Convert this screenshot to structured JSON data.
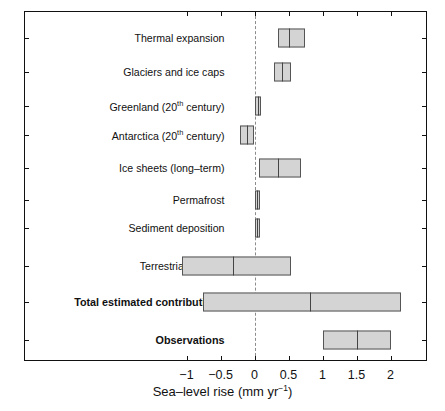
{
  "chart_data": {
    "type": "bar",
    "orientation": "horizontal",
    "title": "",
    "xlabel": "Sea-level rise (mm yr<sup>-1</sup>)",
    "xlabel_text": "Sea–level rise (mm yr",
    "xlabel_sup": "−1",
    "xlabel_tail": ")",
    "ylabel": "",
    "xlim": [
      -1.25,
      2.3
    ],
    "grid": false,
    "legend": null,
    "zero_reference_line": 0,
    "xticks": [
      -1,
      -0.5,
      0,
      0.5,
      1,
      1.5,
      2
    ],
    "xtick_labels": [
      "−1",
      "−0.5",
      "0",
      "0.5",
      "1",
      "1.5",
      "2"
    ],
    "categories": [
      "Thermal expansion",
      "Glaciers and ice caps",
      "Greenland (20th century)",
      "Antarctica (20th century)",
      "Ice sheets (long–term)",
      "Permafrost",
      "Sediment deposition",
      "Terrestrial storage",
      "Total estimated contributions",
      "Observations"
    ],
    "ranges": [
      {
        "label": "Thermal expansion",
        "low": 0.34,
        "high": 0.75,
        "center": 0.5,
        "bold": false
      },
      {
        "label": "Glaciers and ice caps",
        "low": 0.28,
        "high": 0.53,
        "center": 0.41,
        "bold": false
      },
      {
        "label": "Greenland (20th century)",
        "low": 0.0,
        "high": 0.1,
        "center": 0.05,
        "bold": false
      },
      {
        "label": "Antarctica (20th century)",
        "low": -0.21,
        "high": 0.0,
        "center": -0.11,
        "bold": false
      },
      {
        "label": "Ice sheets (long-term)",
        "low": 0.06,
        "high": 0.68,
        "center": 0.35,
        "bold": false
      },
      {
        "label": "Permafrost",
        "low": 0.0,
        "high": 0.08,
        "center": 0.04,
        "bold": false
      },
      {
        "label": "Sediment deposition",
        "low": 0.0,
        "high": 0.08,
        "center": 0.04,
        "bold": false
      },
      {
        "label": "Terrestrial storage",
        "low": -1.06,
        "high": 0.54,
        "center": -0.32,
        "bold": false
      },
      {
        "label": "Total estimated contributions",
        "low": -0.76,
        "high": 2.15,
        "center": 0.82,
        "bold": true
      },
      {
        "label": "Observations",
        "low": 1.0,
        "high": 2.0,
        "center": 1.5,
        "bold": true
      }
    ],
    "bar_fill_color": "#d4d4d4",
    "bar_edge_color": "#555555",
    "zero_line_color": "#8c8c8c",
    "axis_color": "#111111"
  },
  "labels": {
    "rows": [
      {
        "prefix": "Thermal expansion",
        "sup": "",
        "suffix": "",
        "bold": false
      },
      {
        "prefix": "Glaciers and ice caps",
        "sup": "",
        "suffix": "",
        "bold": false
      },
      {
        "prefix": "Greenland (20",
        "sup": "th",
        "suffix": " century)",
        "bold": false
      },
      {
        "prefix": "Antarctica (20",
        "sup": "th",
        "suffix": " century)",
        "bold": false
      },
      {
        "prefix": "Ice sheets (long–term)",
        "sup": "",
        "suffix": "",
        "bold": false
      },
      {
        "prefix": "Permafrost",
        "sup": "",
        "suffix": "",
        "bold": false
      },
      {
        "prefix": "Sediment deposition",
        "sup": "",
        "suffix": "",
        "bold": false
      },
      {
        "prefix": "Terrestrial storage",
        "sup": "",
        "suffix": "",
        "bold": false
      },
      {
        "prefix": "Total estimated contributions",
        "sup": "",
        "suffix": "",
        "bold": true
      },
      {
        "prefix": "Observations",
        "sup": "",
        "suffix": "",
        "bold": true
      }
    ]
  },
  "axis": {
    "title_prefix": "Sea–level rise (mm yr",
    "title_sup": "−1",
    "title_suffix": ")"
  },
  "geometry": {
    "x0_px": 254.5,
    "px_per_unit": 68.0,
    "row_y_px": [
      38,
      72,
      106,
      135,
      168,
      200,
      228,
      266,
      302,
      340
    ],
    "bar_height_px": 19,
    "small_bar_height_px": 19
  }
}
